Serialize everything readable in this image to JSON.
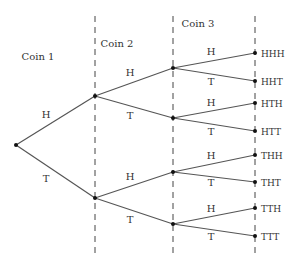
{
  "stages": [
    {
      "label": "Coin 1",
      "x": 38,
      "y": 60
    },
    {
      "label": "Coin 2",
      "x": 117,
      "y": 47
    },
    {
      "label": "Coin 3",
      "x": 198,
      "y": 27
    }
  ],
  "dividers": [
    95,
    173,
    255
  ],
  "root": {
    "x": 16,
    "y": 145
  },
  "branches": [
    {
      "from": [
        16,
        145
      ],
      "to": [
        95,
        96
      ],
      "label": "H",
      "lx": 46,
      "ly": 118
    },
    {
      "from": [
        16,
        145
      ],
      "to": [
        95,
        198
      ],
      "label": "T",
      "lx": 46,
      "ly": 182
    },
    {
      "from": [
        95,
        96
      ],
      "to": [
        173,
        68
      ],
      "label": "H",
      "lx": 130,
      "ly": 76
    },
    {
      "from": [
        95,
        96
      ],
      "to": [
        173,
        118
      ],
      "label": "T",
      "lx": 130,
      "ly": 119
    },
    {
      "from": [
        95,
        198
      ],
      "to": [
        173,
        172
      ],
      "label": "H",
      "lx": 130,
      "ly": 180
    },
    {
      "from": [
        95,
        198
      ],
      "to": [
        173,
        224
      ],
      "label": "T",
      "lx": 130,
      "ly": 223
    },
    {
      "from": [
        173,
        68
      ],
      "to": [
        255,
        53
      ],
      "label": "H",
      "lx": 211,
      "ly": 55
    },
    {
      "from": [
        173,
        68
      ],
      "to": [
        255,
        81
      ],
      "label": "T",
      "lx": 211,
      "ly": 85
    },
    {
      "from": [
        173,
        118
      ],
      "to": [
        255,
        103
      ],
      "label": "H",
      "lx": 211,
      "ly": 106
    },
    {
      "from": [
        173,
        118
      ],
      "to": [
        255,
        131
      ],
      "label": "T",
      "lx": 211,
      "ly": 135
    },
    {
      "from": [
        173,
        172
      ],
      "to": [
        255,
        155
      ],
      "label": "H",
      "lx": 211,
      "ly": 159
    },
    {
      "from": [
        173,
        172
      ],
      "to": [
        255,
        182
      ],
      "label": "T",
      "lx": 211,
      "ly": 186
    },
    {
      "from": [
        173,
        224
      ],
      "to": [
        255,
        208
      ],
      "label": "H",
      "lx": 211,
      "ly": 212
    },
    {
      "from": [
        173,
        224
      ],
      "to": [
        255,
        236
      ],
      "label": "T",
      "lx": 211,
      "ly": 240
    }
  ],
  "nodes": [
    [
      95,
      96
    ],
    [
      95,
      198
    ],
    [
      173,
      68
    ],
    [
      173,
      118
    ],
    [
      173,
      172
    ],
    [
      173,
      224
    ]
  ],
  "outcomes": [
    {
      "label": "HHH",
      "y": 53
    },
    {
      "label": "HHT",
      "y": 81
    },
    {
      "label": "HTH",
      "y": 103
    },
    {
      "label": "HTT",
      "y": 131
    },
    {
      "label": "THH",
      "y": 155
    },
    {
      "label": "THT",
      "y": 182
    },
    {
      "label": "TTH",
      "y": 208
    },
    {
      "label": "TTT",
      "y": 236
    }
  ]
}
